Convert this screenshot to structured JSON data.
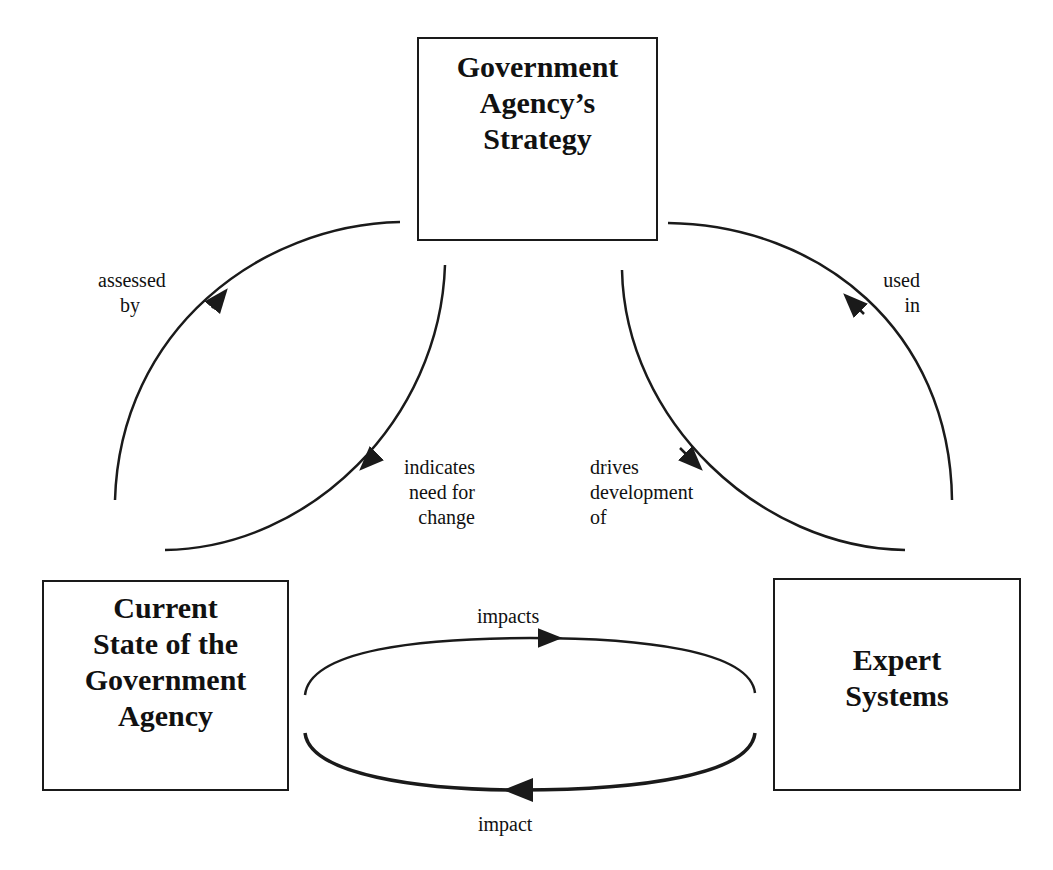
{
  "nodes": {
    "strategy": {
      "lines": [
        "Government",
        "Agency’s",
        "Strategy"
      ]
    },
    "current_state": {
      "lines": [
        "Current",
        "State of the",
        "Government",
        "Agency"
      ]
    },
    "expert_systems": {
      "lines": [
        "Expert",
        "Systems"
      ]
    }
  },
  "edges": {
    "assessed_by": {
      "lines": [
        "assessed",
        "by"
      ],
      "from": "current_state",
      "to": "strategy"
    },
    "indicates_need": {
      "lines": [
        "indicates",
        "need for",
        "change"
      ],
      "from": "strategy",
      "to": "current_state"
    },
    "drives_development": {
      "lines": [
        "drives",
        "development",
        "of"
      ],
      "from": "strategy",
      "to": "expert_systems"
    },
    "used_in": {
      "lines": [
        "used",
        "in"
      ],
      "from": "expert_systems",
      "to": "strategy"
    },
    "impacts": {
      "label": "impacts",
      "from": "current_state",
      "to": "expert_systems"
    },
    "impact": {
      "label": "impact",
      "from": "expert_systems",
      "to": "current_state"
    }
  },
  "colors": {
    "line": "#1a1a1a",
    "background": "#ffffff"
  }
}
